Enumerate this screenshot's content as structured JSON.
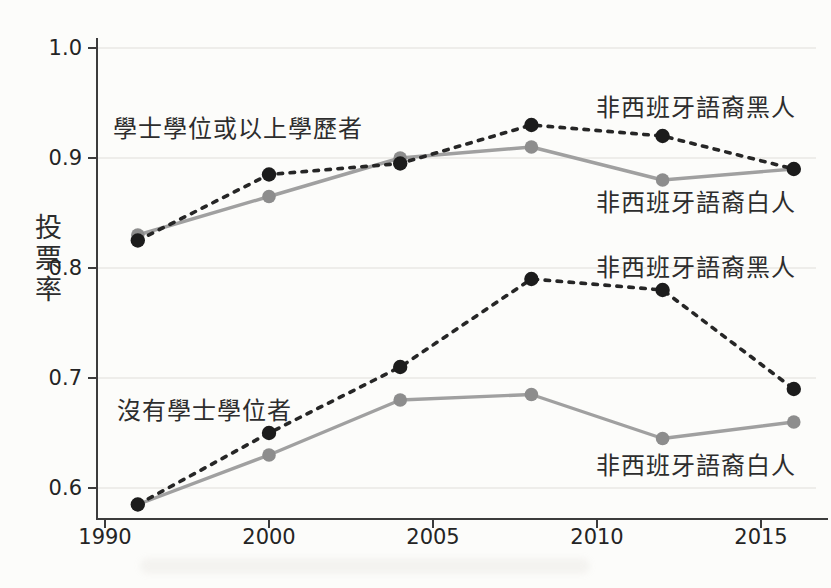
{
  "chart_data": {
    "type": "line",
    "title": "",
    "ylabel": "投票率",
    "x_years": [
      1992,
      2000,
      2004,
      2008,
      2012,
      2016
    ],
    "x_tick_years": [
      1990,
      2000,
      2005,
      2010,
      2015
    ],
    "x_tick_labels": [
      "1990",
      "2000",
      "2005",
      "2010",
      "2015"
    ],
    "y_ticks": [
      1.0,
      0.9,
      0.8,
      0.7,
      0.6
    ],
    "y_tick_labels": [
      "1.0",
      "0.9",
      "0.8",
      "0.7",
      "0.6"
    ],
    "ylim": [
      0.6,
      1.0
    ],
    "grid": "horizontal-faint",
    "legend_position": "annotations-inline",
    "groups": [
      {
        "name": "bachelor-or-higher",
        "label": "學士學位或以上學歷者"
      },
      {
        "name": "no-bachelor",
        "label": "沒有學士學位者"
      }
    ],
    "series": [
      {
        "name": "college-black",
        "label": "非西班牙語裔黑人",
        "group": "bachelor-or-higher",
        "line_style": "dashed",
        "color": "#262626",
        "marker_color": "#1c1c1c",
        "values": [
          0.825,
          0.885,
          0.895,
          0.93,
          0.92,
          0.89
        ]
      },
      {
        "name": "college-white",
        "label": "非西班牙語裔白人",
        "group": "bachelor-or-higher",
        "line_style": "solid",
        "color": "#a0a0a0",
        "marker_color": "#8d8d8d",
        "values": [
          0.83,
          0.865,
          0.9,
          0.91,
          0.88,
          0.89
        ]
      },
      {
        "name": "noncollege-black",
        "label": "非西班牙語裔黑人",
        "group": "no-bachelor",
        "line_style": "dashed",
        "color": "#262626",
        "marker_color": "#1c1c1c",
        "values": [
          0.585,
          0.65,
          0.71,
          0.79,
          0.78,
          0.69
        ]
      },
      {
        "name": "noncollege-white",
        "label": "非西班牙語裔白人",
        "group": "no-bachelor",
        "line_style": "solid",
        "color": "#a0a0a0",
        "marker_color": "#8d8d8d",
        "values": [
          0.585,
          0.63,
          0.68,
          0.685,
          0.645,
          0.66
        ]
      }
    ],
    "style": {
      "axis_color": "#3c3c3c",
      "grid_color": "#eae8e4",
      "background": "#fcfcfa",
      "text_color": "#2d2d2d"
    }
  }
}
